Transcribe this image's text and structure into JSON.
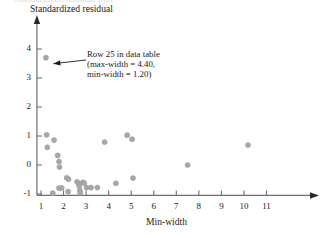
{
  "figure": {
    "caption_remnant": "Standardized residual plot",
    "annotation": {
      "name": "outlier-callout",
      "lines": [
        "Row 25 in data table",
        "(max-width = 4.40,",
        "min-width = 1.20)"
      ]
    }
  },
  "chart_data": {
    "type": "scatter",
    "title": "",
    "xlabel": "Min-width",
    "ylabel": "Standardized residual",
    "xlim": [
      0.55,
      11.8
    ],
    "ylim": [
      -1.25,
      4.55
    ],
    "xticks": [
      1,
      2,
      3,
      4,
      5,
      6,
      7,
      8,
      9,
      10,
      11
    ],
    "xtick_labels": [
      "1",
      "2",
      "3",
      "4",
      "5",
      "6",
      "7",
      "8",
      "9",
      "10",
      "11"
    ],
    "yticks": [
      -1,
      0,
      1,
      2,
      3,
      4
    ],
    "ytick_labels": [
      "-1",
      "0",
      "1",
      "2",
      "3",
      "4"
    ],
    "grid": false,
    "legend": null,
    "marker": {
      "shape": "circle",
      "radius_px": 2.6,
      "color": "#a7a7a7",
      "edge_color": "#9a9a9a"
    },
    "axis_color": "#6f6f6f",
    "points": [
      {
        "x": 1.22,
        "y": 3.7,
        "label": "Row 25 outlier"
      },
      {
        "x": 1.25,
        "y": 1.04
      },
      {
        "x": 1.28,
        "y": 0.61
      },
      {
        "x": 1.58,
        "y": 0.86
      },
      {
        "x": 1.52,
        "y": -0.97
      },
      {
        "x": 1.74,
        "y": 0.33
      },
      {
        "x": 1.8,
        "y": 0.12
      },
      {
        "x": 1.82,
        "y": -0.07
      },
      {
        "x": 1.8,
        "y": -0.8
      },
      {
        "x": 1.92,
        "y": -0.79
      },
      {
        "x": 2.14,
        "y": -0.44
      },
      {
        "x": 2.22,
        "y": -0.49
      },
      {
        "x": 2.2,
        "y": -0.92
      },
      {
        "x": 2.6,
        "y": -0.58
      },
      {
        "x": 2.66,
        "y": -0.63
      },
      {
        "x": 2.7,
        "y": -0.72
      },
      {
        "x": 2.72,
        "y": -0.88
      },
      {
        "x": 2.74,
        "y": -0.96
      },
      {
        "x": 2.86,
        "y": -0.6
      },
      {
        "x": 2.92,
        "y": -0.62
      },
      {
        "x": 3.02,
        "y": -0.78
      },
      {
        "x": 3.22,
        "y": -0.78
      },
      {
        "x": 3.5,
        "y": -0.78
      },
      {
        "x": 3.82,
        "y": 0.79
      },
      {
        "x": 4.32,
        "y": -0.63
      },
      {
        "x": 4.82,
        "y": 1.03
      },
      {
        "x": 5.04,
        "y": 0.89
      },
      {
        "x": 5.08,
        "y": -0.45
      },
      {
        "x": 7.5,
        "y": 0.0
      },
      {
        "x": 10.18,
        "y": 0.69
      }
    ],
    "annotations": [
      {
        "text": "Row 25 in data table\n(max-width = 4.40,\nmin-width = 1.20)",
        "points_to": {
          "x": 1.22,
          "y": 3.7
        }
      }
    ]
  }
}
